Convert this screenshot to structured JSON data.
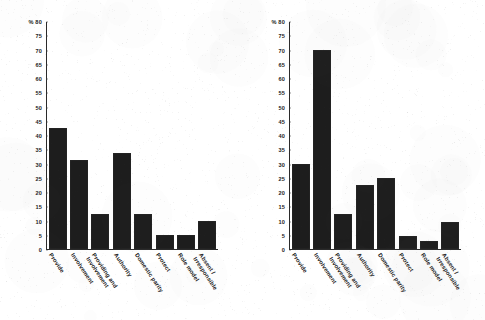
{
  "figure": {
    "panels": [
      {
        "id": "left",
        "position": "left"
      },
      {
        "id": "right",
        "position": "right"
      }
    ]
  },
  "chart_data": [
    {
      "type": "bar",
      "title": "",
      "xlabel": "",
      "ylabel": "%",
      "ylim": [
        0,
        80
      ],
      "yticks": [
        0,
        5,
        10,
        15,
        20,
        25,
        30,
        35,
        40,
        45,
        50,
        55,
        60,
        65,
        70,
        75,
        80
      ],
      "ytick_labels": [
        "0",
        "5",
        "10",
        "15",
        "20",
        "25",
        "30",
        "35",
        "40",
        "45",
        "50",
        "55",
        "60",
        "65",
        "70",
        "75",
        "% 80"
      ],
      "grid": false,
      "legend": "none",
      "bar_color": "#1d1d1d",
      "categories": [
        "Provide",
        "Involvement",
        "Providing and Involvement",
        "Authority",
        "Domestic parity",
        "Protect",
        "Role model",
        "Absent / Irresponsible"
      ],
      "category_lines": [
        [
          "Provide"
        ],
        [
          "Involvement"
        ],
        [
          "Providing and",
          "Involvement"
        ],
        [
          "Authority"
        ],
        [
          "Domestic parity"
        ],
        [
          "Protect"
        ],
        [
          "Role model"
        ],
        [
          "Absent /",
          "Irresponsible"
        ]
      ],
      "values": [
        42.5,
        31.5,
        12.5,
        34,
        12.5,
        5,
        5,
        10
      ]
    },
    {
      "type": "bar",
      "title": "",
      "xlabel": "",
      "ylabel": "%",
      "ylim": [
        0,
        80
      ],
      "yticks": [
        0,
        5,
        10,
        15,
        20,
        25,
        30,
        35,
        40,
        45,
        50,
        55,
        60,
        65,
        70,
        75,
        80
      ],
      "ytick_labels": [
        "0",
        "5",
        "10",
        "15",
        "20",
        "25",
        "30",
        "35",
        "40",
        "45",
        "50",
        "55",
        "60",
        "65",
        "70",
        "75",
        "% 80"
      ],
      "grid": false,
      "legend": "none",
      "bar_color": "#1d1d1d",
      "categories": [
        "Provide",
        "Involvement",
        "Providing and Involvement",
        "Authority",
        "Domestic parity",
        "Protect",
        "Role model",
        "Absent / Irresponsible"
      ],
      "category_lines": [
        [
          "Provide"
        ],
        [
          "Involvement"
        ],
        [
          "Providing and",
          "Involvement"
        ],
        [
          "Authority"
        ],
        [
          "Domestic parity"
        ],
        [
          "Protect"
        ],
        [
          "Role model"
        ],
        [
          "Absent /",
          "Irresponsible"
        ]
      ],
      "values": [
        30,
        70,
        12.5,
        22.5,
        25,
        4.5,
        3,
        9.5
      ]
    }
  ]
}
